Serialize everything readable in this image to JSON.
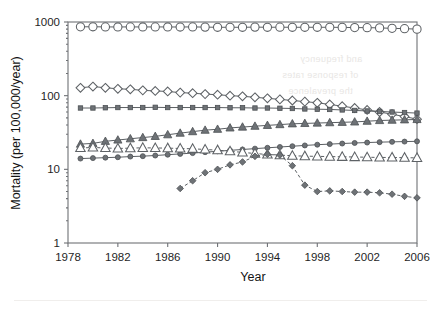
{
  "figure": {
    "background": "#ffffff",
    "frame_color": "#6f7276"
  },
  "chart_data": {
    "type": "line",
    "title": "",
    "xlabel": "Year",
    "ylabel": "Mortality (per 100,000/year)",
    "yscale": "log",
    "ylim": [
      1,
      1000
    ],
    "xlim": [
      1978,
      2006
    ],
    "ytick_labels": [
      "1000",
      "100",
      "10",
      "1"
    ],
    "ytick_values": [
      1000,
      100,
      10,
      1
    ],
    "xtick_labels": [
      "1978",
      "1982",
      "1986",
      "1990",
      "1994",
      "1998",
      "2002",
      "2006"
    ],
    "xtick_values": [
      1978,
      1982,
      1986,
      1990,
      1994,
      1998,
      2002,
      2006
    ],
    "grid": false,
    "legend": "none",
    "x": [
      1979,
      1980,
      1981,
      1982,
      1983,
      1984,
      1985,
      1986,
      1987,
      1988,
      1989,
      1990,
      1991,
      1992,
      1993,
      1994,
      1995,
      1996,
      1997,
      1998,
      1999,
      2000,
      2001,
      2002,
      2003,
      2004,
      2005,
      2006
    ],
    "series": [
      {
        "name": "all-causes",
        "marker": "open-circle",
        "linestyle": "solid",
        "x": [
          1979,
          1980,
          1981,
          1982,
          1983,
          1984,
          1985,
          1986,
          1987,
          1988,
          1989,
          1990,
          1991,
          1992,
          1993,
          1994,
          1995,
          1996,
          1997,
          1998,
          1999,
          2000,
          2001,
          2002,
          2003,
          2004,
          2005,
          2006
        ],
        "values": [
          860,
          862,
          858,
          856,
          858,
          856,
          858,
          856,
          855,
          858,
          852,
          848,
          848,
          848,
          852,
          848,
          850,
          848,
          848,
          848,
          848,
          845,
          840,
          838,
          832,
          820,
          812,
          800
        ]
      },
      {
        "name": "series-open-diamond",
        "marker": "open-diamond",
        "linestyle": "solid",
        "x": [
          1979,
          1980,
          1981,
          1982,
          1983,
          1984,
          1985,
          1986,
          1987,
          1988,
          1989,
          1990,
          1991,
          1992,
          1993,
          1994,
          1995,
          1996,
          1997,
          1998,
          1999,
          2000,
          2001,
          2002,
          2003,
          2004,
          2005,
          2006
        ],
        "values": [
          128,
          133,
          128,
          124,
          122,
          118,
          116,
          114,
          110,
          108,
          105,
          103,
          100,
          98,
          95,
          92,
          89,
          86,
          83,
          80,
          76,
          72,
          68,
          64,
          60,
          56,
          52,
          48
        ]
      },
      {
        "name": "series-filled-square",
        "marker": "filled-square",
        "linestyle": "solid",
        "x": [
          1979,
          1980,
          1981,
          1982,
          1983,
          1984,
          1985,
          1986,
          1987,
          1988,
          1989,
          1990,
          1991,
          1992,
          1993,
          1994,
          1995,
          1996,
          1997,
          1998,
          1999,
          2000,
          2001,
          2002,
          2003,
          2004,
          2005,
          2006
        ],
        "values": [
          68,
          68,
          68.5,
          69,
          69,
          69,
          69.5,
          69,
          69,
          69,
          69,
          69,
          68.5,
          68.5,
          68,
          68,
          67.5,
          67,
          66,
          65.5,
          65,
          64,
          63,
          62,
          61,
          60,
          59,
          58
        ]
      },
      {
        "name": "series-filled-triangle",
        "marker": "filled-triangle",
        "linestyle": "solid",
        "x": [
          1979,
          1980,
          1981,
          1982,
          1983,
          1984,
          1985,
          1986,
          1987,
          1988,
          1989,
          1990,
          1991,
          1992,
          1993,
          1994,
          1995,
          1996,
          1997,
          1998,
          1999,
          2000,
          2001,
          2002,
          2003,
          2004,
          2005,
          2006
        ],
        "values": [
          22,
          22.5,
          24,
          25,
          26,
          27,
          28,
          29.5,
          31,
          32.5,
          34,
          35,
          36.5,
          37.5,
          38.5,
          39.5,
          40.5,
          41.5,
          42,
          42.5,
          43,
          43.5,
          44,
          45,
          46,
          46.5,
          47,
          47.5
        ]
      },
      {
        "name": "series-filled-circle",
        "marker": "filled-circle",
        "linestyle": "solid",
        "x": [
          1979,
          1980,
          1981,
          1982,
          1983,
          1984,
          1985,
          1986,
          1987,
          1988,
          1989,
          1990,
          1991,
          1992,
          1993,
          1994,
          1995,
          1996,
          1997,
          1998,
          1999,
          2000,
          2001,
          2002,
          2003,
          2004,
          2005,
          2006
        ],
        "values": [
          14,
          14.2,
          14.4,
          14.6,
          14.9,
          15.1,
          15.4,
          15.8,
          16.2,
          16.6,
          17.1,
          17.6,
          18.1,
          18.6,
          19.1,
          19.6,
          20.1,
          20.6,
          21.1,
          21.6,
          22.0,
          22.4,
          22.8,
          23.1,
          23.4,
          23.6,
          23.8,
          24.0
        ]
      },
      {
        "name": "series-open-triangle",
        "marker": "open-triangle",
        "linestyle": "dashed",
        "x": [
          1979,
          1980,
          1981,
          1982,
          1983,
          1984,
          1985,
          1986,
          1987,
          1988,
          1989,
          1990,
          1991,
          1992,
          1993,
          1994,
          1995,
          1996,
          1997,
          1998,
          1999,
          2000,
          2001,
          2002,
          2003,
          2004,
          2005,
          2006
        ],
        "values": [
          19.5,
          19.8,
          19.5,
          19.2,
          19.4,
          19.6,
          19.5,
          19.4,
          19.2,
          19.0,
          18.6,
          18.2,
          17.6,
          17.0,
          16.4,
          15.9,
          15.6,
          15.3,
          15.1,
          15.0,
          14.9,
          14.8,
          14.7,
          14.6,
          14.5,
          14.5,
          14.4,
          14.3
        ]
      },
      {
        "name": "series-filled-diamond",
        "marker": "filled-diamond",
        "linestyle": "dashed",
        "x": [
          1987,
          1988,
          1989,
          1990,
          1991,
          1992,
          1993,
          1994,
          1995,
          1996,
          1997,
          1998,
          1999,
          2000,
          2001,
          2002,
          2003,
          2004,
          2005,
          2006
        ],
        "values": [
          5.5,
          7.0,
          9.0,
          10.0,
          11.5,
          12.6,
          15.0,
          16.0,
          15.6,
          11.2,
          6.1,
          5.0,
          5.1,
          5.0,
          4.9,
          4.9,
          4.8,
          4.6,
          4.3,
          4.1
        ]
      }
    ]
  },
  "bleed_text": {
    "note": "faint reverse-side show-through text, not chart content",
    "lines": [
      "and frequency",
      "of response rates",
      "the prevalence"
    ]
  }
}
